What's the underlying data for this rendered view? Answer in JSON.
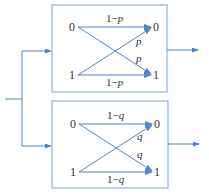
{
  "colors": {
    "line": "#4a86c8",
    "box_border": "#8fb0dc",
    "text": "#333333"
  },
  "channels": [
    {
      "name": "channel-p",
      "inputs": [
        "0",
        "1"
      ],
      "outputs": [
        "0",
        "1"
      ],
      "top_label_prefix": "1−",
      "bottom_label_prefix": "1−",
      "param": "p",
      "cross_upper": "p",
      "cross_lower": "p"
    },
    {
      "name": "channel-q",
      "inputs": [
        "0",
        "1"
      ],
      "outputs": [
        "0",
        "1"
      ],
      "top_label_prefix": "1−",
      "bottom_label_prefix": "1−",
      "param": "q",
      "cross_upper": "q",
      "cross_lower": "q"
    }
  ]
}
